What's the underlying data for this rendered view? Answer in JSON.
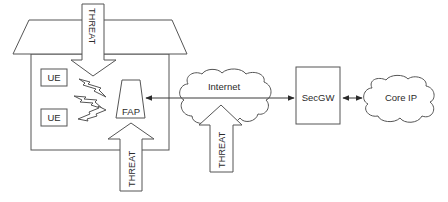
{
  "diagram": {
    "type": "network-threat-diagram",
    "house": {
      "label": "",
      "ue_devices": [
        {
          "label": "UE"
        },
        {
          "label": "UE"
        }
      ],
      "fap": {
        "label": "FAP"
      }
    },
    "clouds": {
      "internet": {
        "label": "Internet"
      },
      "core": {
        "label": "Core IP"
      }
    },
    "gateway": {
      "label": "SecGW"
    },
    "threats": [
      {
        "label": "THREAT",
        "direction": "down",
        "target": "UE wireless link"
      },
      {
        "label": "THREAT",
        "direction": "up",
        "target": "FAP"
      },
      {
        "label": "THREAT",
        "direction": "up",
        "target": "Internet"
      }
    ],
    "connections": [
      {
        "from": "FAP",
        "to": "SecGW",
        "via": "Internet",
        "arrows": "both"
      },
      {
        "from": "SecGW",
        "to": "Core IP",
        "arrows": "both"
      },
      {
        "from": "UE",
        "to": "FAP",
        "type": "wireless"
      }
    ],
    "colors": {
      "stroke": "#555555",
      "text": "#2b2b2b",
      "background": "#ffffff"
    }
  }
}
